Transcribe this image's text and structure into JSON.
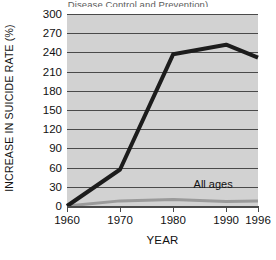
{
  "caption": {
    "clipped_text": "Disease Control and Prevention)"
  },
  "chart_data": {
    "type": "line",
    "title": "",
    "xlabel": "YEAR",
    "ylabel": "INCREASE IN SUICIDE RATE (%)",
    "x": [
      1960,
      1970,
      1980,
      1990,
      1996
    ],
    "xtick_labels": [
      "1960",
      "1970",
      "1980",
      "1990",
      "1996"
    ],
    "xlim": [
      1960,
      1996
    ],
    "ylim": [
      0,
      300
    ],
    "ytick_labels": [
      "0",
      "30",
      "60",
      "90",
      "120",
      "150",
      "180",
      "210",
      "240",
      "270",
      "300"
    ],
    "yticks": [
      0,
      30,
      60,
      90,
      120,
      150,
      180,
      210,
      240,
      270,
      300
    ],
    "grid": "horizontal",
    "legend": "inline-annotation",
    "plot_background": "#d2d2d2",
    "series": [
      {
        "name": "Youth suicide rate increase",
        "label": "",
        "color": "#1c1c1c",
        "width": 4,
        "values": [
          0,
          57,
          237,
          252,
          232
        ]
      },
      {
        "name": "All ages",
        "label": "All ages",
        "color": "#9a9a9a",
        "width": 3,
        "values": [
          0,
          8,
          10,
          7,
          8
        ]
      }
    ]
  }
}
